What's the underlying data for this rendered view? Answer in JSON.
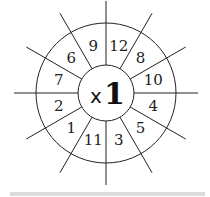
{
  "wheel": {
    "center_label_prefix": "x",
    "center_label_number": "1",
    "segments": [
      "9",
      "12",
      "8",
      "10",
      "4",
      "5",
      "3",
      "11",
      "1",
      "2",
      "7",
      "6"
    ],
    "line_color": "#222222",
    "text_color": "#222222"
  },
  "bottom_bar": {
    "color": "#dcdcdc"
  }
}
